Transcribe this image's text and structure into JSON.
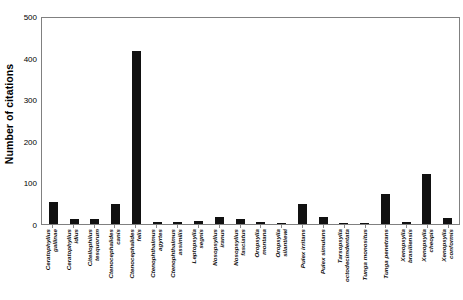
{
  "chart_data": {
    "type": "bar",
    "title": "",
    "xlabel": "",
    "ylabel": "Number of citations",
    "ylim": [
      0,
      500
    ],
    "yticks": [
      0,
      100,
      200,
      300,
      400,
      500
    ],
    "grid": false,
    "legend": "none",
    "bar_color": "#111111",
    "axis_color": "#808080",
    "categories": [
      "Ceratophyllus gallinae",
      "Ceratophyllus idius",
      "Citellophilus tesquorum",
      "Ctenocephalides canis",
      "Ctenocephalides felis",
      "Ctenophthalmus agyrtes",
      "Ctenophthalmus assimilis",
      "Leptopsylla segnis",
      "Nosopsyllus iranus",
      "Nosopsyllus fasciatus",
      "Oropsylla montana",
      "Oropsylla silantiewi",
      "Pulex irritans",
      "Pulex simulans",
      "Tarsopsylla octodecimdentata",
      "Tunga monositus",
      "Tunga penetrans",
      "Xenopsylla brasiliensis",
      "Xenopsylla cheopis",
      "Xenopsylla conformis"
    ],
    "categories_lines": [
      [
        "Ceratophyllus",
        "gallinae"
      ],
      [
        "Ceratophyllus",
        "idius"
      ],
      [
        "Citellophilus",
        "tesquorum"
      ],
      [
        "Ctenocephalides",
        "canis"
      ],
      [
        "Ctenocephalides",
        "felis"
      ],
      [
        "Ctenophthalmus",
        "agyrtes"
      ],
      [
        "Ctenophthalmus",
        "assimilis"
      ],
      [
        "Leptopsylla",
        "segnis"
      ],
      [
        "Nosopsyllus",
        "iranus"
      ],
      [
        "Nosopsyllus",
        "fasciatus"
      ],
      [
        "Oropsylla",
        "montana"
      ],
      [
        "Oropsylla",
        "silantiewi"
      ],
      [
        "Pulex irritans",
        ""
      ],
      [
        "Pulex simulans",
        ""
      ],
      [
        "Tarsopsylla",
        "octodecimdentata"
      ],
      [
        "Tunga monositus",
        ""
      ],
      [
        "Tunga penetrans",
        ""
      ],
      [
        "Xenopsylla",
        "brasiliensis"
      ],
      [
        "Xenopsylla",
        "cheopis"
      ],
      [
        "Xenopsylla",
        "conformis"
      ]
    ],
    "values": [
      53,
      11,
      12,
      48,
      415,
      5,
      4,
      7,
      18,
      11,
      6,
      2,
      48,
      16,
      2,
      2,
      72,
      6,
      120,
      15
    ]
  }
}
